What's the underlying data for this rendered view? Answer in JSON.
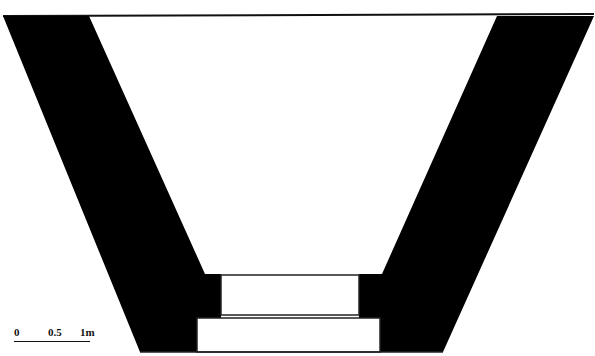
{
  "figure": {
    "type": "cross-section drawing",
    "fill_color": "#000000",
    "background_color": "#ffffff"
  },
  "scale_bar": {
    "ticks": [
      "0",
      "0.5",
      "1m"
    ]
  }
}
